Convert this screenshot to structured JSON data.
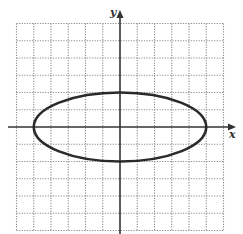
{
  "chart_data": {
    "type": "line",
    "title": "",
    "xlabel": "x",
    "ylabel": "y",
    "xlim": [
      -6,
      6
    ],
    "ylim": [
      -6,
      6
    ],
    "grid": true,
    "grid_style": "dotted",
    "tick_labels": "none",
    "series": [
      {
        "name": "ellipse",
        "shape": "ellipse",
        "center": [
          0,
          0
        ],
        "semi_major_x": 5,
        "semi_minor_y": 2,
        "equation": "x^2/25 + y^2/4 = 1",
        "vertices": [
          [
            -5,
            0
          ],
          [
            5,
            0
          ],
          [
            0,
            2
          ],
          [
            0,
            -2
          ]
        ]
      }
    ]
  },
  "labels": {
    "x_axis": "x",
    "y_axis": "y"
  },
  "colors": {
    "grid": "#8a8a8a",
    "axis": "#333333",
    "curve": "#2a2a2a",
    "background": "#ffffff"
  },
  "layout": {
    "origin_px": [
      120,
      127
    ],
    "unit_px": 17.25,
    "grid_left": 15,
    "grid_top": 23
  }
}
